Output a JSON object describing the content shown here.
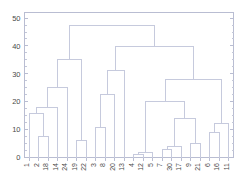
{
  "figure": {
    "title": "",
    "background_color": "#ffffff",
    "line_color": "#c6cadd",
    "axis_color": "#b9bdd2",
    "text_color": "#4a4a4a"
  },
  "chart_data": {
    "type": "dendrogram",
    "title": "",
    "xlabel": "",
    "ylabel": "",
    "ylim": [
      0,
      52
    ],
    "yticks": [
      0,
      10,
      20,
      30,
      40,
      50
    ],
    "ytick_labels": [
      "0",
      "10",
      "20",
      "30",
      "40",
      "50"
    ],
    "yminor_ticks": [
      2.5,
      5,
      7.5,
      12.5,
      15,
      17.5,
      22.5,
      25,
      27.5,
      32.5,
      35,
      37.5,
      42.5,
      45,
      47.5,
      50
    ],
    "grid": false,
    "legend": null,
    "leaf_labels": [
      "1",
      "2",
      "18",
      "14",
      "24",
      "19",
      "22",
      "3",
      "8",
      "20",
      "13",
      "4",
      "12",
      "5",
      "7",
      "30",
      "17",
      "9",
      "21",
      "6",
      "16",
      "11"
    ],
    "leaf_count": 22,
    "leaf_rotation": 90,
    "merges": [
      {
        "id": "m1",
        "left": "2",
        "right": "18",
        "height": 7.5
      },
      {
        "id": "m2",
        "left": "1",
        "right": "m1",
        "height": 15.9
      },
      {
        "id": "m3",
        "left": "m2",
        "right": "14",
        "height": 18.0
      },
      {
        "id": "m4",
        "left": "m3",
        "right": "24",
        "height": 25.0
      },
      {
        "id": "m5",
        "left": "19",
        "right": "22",
        "height": 6.2
      },
      {
        "id": "m6",
        "left": "m4",
        "right": "m5",
        "height": 35.2
      },
      {
        "id": "m7",
        "left": "3",
        "right": "8",
        "height": 10.6
      },
      {
        "id": "m8",
        "left": "m7",
        "right": "20",
        "height": 22.6
      },
      {
        "id": "m9",
        "left": "m8",
        "right": "13",
        "height": 31.3
      },
      {
        "id": "m10",
        "left": "4",
        "right": "12",
        "height": 0.9
      },
      {
        "id": "m11",
        "left": "m10",
        "right": "5",
        "height": 1.7
      },
      {
        "id": "m12",
        "left": "7",
        "right": "30",
        "height": 2.7
      },
      {
        "id": "m13",
        "left": "m12",
        "right": "17",
        "height": 4.0
      },
      {
        "id": "m14",
        "left": "9",
        "right": "21",
        "height": 5.0
      },
      {
        "id": "m15",
        "left": "m13",
        "right": "m14",
        "height": 14.0
      },
      {
        "id": "m16",
        "left": "m11",
        "right": "m15",
        "height": 20.2
      },
      {
        "id": "m17",
        "left": "6",
        "right": "16",
        "height": 8.9
      },
      {
        "id": "m18",
        "left": "m17",
        "right": "11",
        "height": 12.3
      },
      {
        "id": "m19",
        "left": "m16",
        "right": "m18",
        "height": 27.8
      },
      {
        "id": "m20",
        "left": "m9",
        "right": "m19",
        "height": 39.8
      },
      {
        "id": "m21",
        "left": "m6",
        "right": "m20",
        "height": 47.2
      }
    ],
    "root": "m21"
  }
}
